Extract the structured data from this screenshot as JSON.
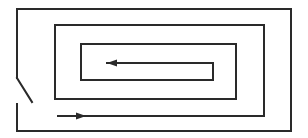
{
  "diagram": {
    "width": 308,
    "height": 138,
    "background": "#ffffff",
    "stroke_color": "#2a2a2a",
    "stroke_width": 2,
    "outer_wall": {
      "upper_segment": [
        [
          17,
          78
        ],
        [
          17,
          9
        ],
        [
          291,
          9
        ],
        [
          291,
          131
        ],
        [
          17,
          131
        ],
        [
          17,
          104
        ]
      ],
      "door_leaf": [
        [
          17,
          78
        ],
        [
          32,
          102
        ]
      ]
    },
    "spiral_path": [
      [
        58,
        116
      ],
      [
        264,
        116
      ],
      [
        264,
        25
      ],
      [
        55,
        25
      ],
      [
        55,
        99
      ],
      [
        236,
        99
      ],
      [
        236,
        44
      ],
      [
        81,
        44
      ],
      [
        81,
        80
      ],
      [
        213,
        80
      ],
      [
        213,
        63
      ],
      [
        107,
        63
      ]
    ],
    "arrows": [
      {
        "name": "entry-arrow",
        "direction": "right",
        "tip": [
          86,
          116
        ],
        "length": 10,
        "half_width": 3.5
      },
      {
        "name": "inner-arrow",
        "direction": "left",
        "tip": [
          107,
          63
        ],
        "length": 10,
        "half_width": 3.5
      }
    ]
  }
}
